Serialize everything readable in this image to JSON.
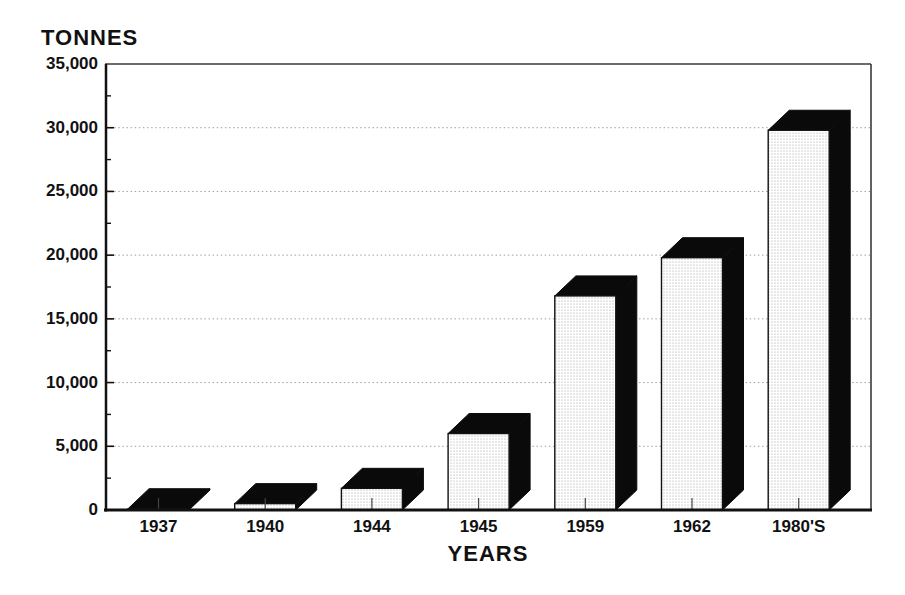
{
  "chart_data": {
    "type": "bar",
    "style": "3d-block-bars",
    "title": "",
    "ylabel": "TONNES",
    "xlabel": "YEARS",
    "categories": [
      "1937",
      "1940",
      "1944",
      "1945",
      "1959",
      "1962",
      "1980'S"
    ],
    "values": [
      100,
      500,
      1700,
      6000,
      16800,
      19800,
      29800
    ],
    "ylim": [
      0,
      35000
    ],
    "ytick_step": 5000,
    "ytick_minor_step": 2500,
    "ytick_labels": [
      "0",
      "5,000",
      "10,000",
      "15,000",
      "20,000",
      "25,000",
      "30,000",
      "35,000"
    ],
    "grid": "dotted horizontal lines at each 5,000 major tick",
    "legend": "none",
    "colors": {
      "background": "#ffffff",
      "bar_face": "#ffffff",
      "bar_face_dots": "#9a9a9a",
      "bar_dark_side": "#0a0a0a",
      "axis": "#111111",
      "box_border": "#3a3a3a",
      "gridline": "#a0a0a0",
      "text": "#111111"
    }
  }
}
